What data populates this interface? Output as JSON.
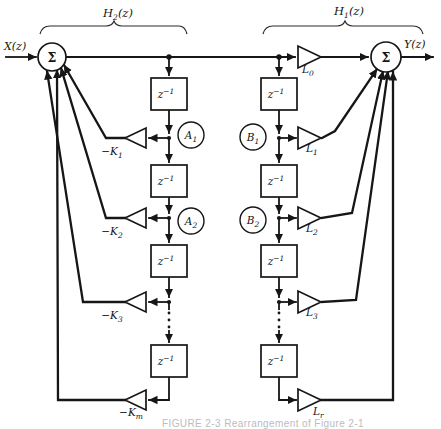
{
  "diagram": {
    "io": {
      "input": "X(z)",
      "output": "Y(z)"
    },
    "section_braces": {
      "left": {
        "base": "H",
        "sub": "2",
        "rest": "(z)"
      },
      "right": {
        "base": "H",
        "sub": "1",
        "rest": "(z)"
      }
    },
    "sum_symbol": "Σ",
    "delay_label": {
      "base": "z",
      "sup": "−1"
    },
    "node_labels": {
      "a1": {
        "base": "A",
        "sub": "1"
      },
      "a2": {
        "base": "A",
        "sub": "2"
      },
      "b1": {
        "base": "B",
        "sub": "1"
      },
      "b2": {
        "base": "B",
        "sub": "2"
      }
    },
    "feedback_gains": {
      "k1": {
        "base": "−K",
        "sub": "1"
      },
      "k2": {
        "base": "−K",
        "sub": "2"
      },
      "k3": {
        "base": "−K",
        "sub": "3"
      },
      "km": {
        "base": "−K",
        "sub": "m"
      }
    },
    "ladder_gains": {
      "l0": {
        "base": "L",
        "sub": "0"
      },
      "l1": {
        "base": "L",
        "sub": "1"
      },
      "l2": {
        "base": "L",
        "sub": "2"
      },
      "l3": {
        "base": "L",
        "sub": "3"
      },
      "lr": {
        "base": "L",
        "sub": "r"
      }
    },
    "caption": "FIGURE 2-3   Rearrangement of Figure 2-1"
  }
}
